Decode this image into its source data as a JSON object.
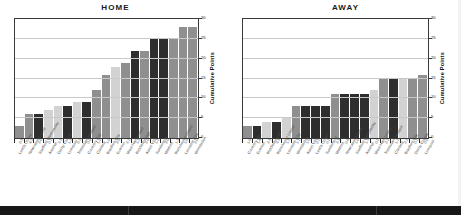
{
  "chart_data": [
    {
      "type": "bar",
      "title": "HOME",
      "xlabel": "",
      "ylabel": "Cumulative Points",
      "ylim": [
        0,
        30
      ],
      "yticks": [
        0,
        5,
        10,
        15,
        20,
        25,
        30
      ],
      "grid": true,
      "legend": "none",
      "categories": [
        "Leeds United",
        "Newcastle United",
        "Sheffield Wednesday",
        "Arsenal",
        "Derby County",
        "Liverpool",
        "Tottenham Hotspur",
        "Coventry City",
        "Chelsea",
        "Bradford City",
        "Everton",
        "West Ham United",
        "Middlesbrough",
        "Aston Villa",
        "Sunderland",
        "Watford",
        "Manchester United",
        "Leicester City",
        "Wimbledon"
      ],
      "scorelines": [
        "0-3",
        "4-2",
        "2-0",
        "0-1",
        "3-3",
        "1-1",
        "0-1",
        "0-0",
        "1-2",
        "1-0",
        "2-0",
        "2-1",
        "1-1",
        "2-0",
        "1-2",
        "2-0",
        "1-3",
        "1-0",
        "2-0"
      ],
      "values": [
        3,
        6,
        6,
        7,
        8,
        8,
        9,
        9,
        12,
        16,
        18,
        19,
        22,
        22,
        25,
        25,
        25,
        28,
        28
      ],
      "bar_shades": [
        "mid",
        "mid",
        "dark",
        "light",
        "light",
        "dark",
        "light",
        "dark",
        "mid",
        "mid",
        "light",
        "mid",
        "dark",
        "mid",
        "dark",
        "dark",
        "mid",
        "mid",
        "mid"
      ]
    },
    {
      "type": "bar",
      "title": "AWAY",
      "xlabel": "",
      "ylabel": "Cumulative Points",
      "ylim": [
        0,
        30
      ],
      "yticks": [
        0,
        5,
        10,
        15,
        20,
        25,
        30
      ],
      "grid": true,
      "legend": "none",
      "categories": [
        "Coventry City",
        "Everton",
        "Middlesbrough",
        "Manchester United",
        "Leicester City",
        "Wimbledon",
        "Aston Villa",
        "Leeds United",
        "Sunderland",
        "Watford",
        "Newcastle United",
        "Sheffield Wednesday",
        "Arsenal",
        "West Ham United",
        "Tottenham Hotspur",
        "Chelsea",
        "Bradford City",
        "Derby County",
        "Liverpool"
      ],
      "scorelines": [
        "1-0",
        "1-4",
        "2-3",
        "3-3",
        "1-3",
        "1-1",
        "1-0",
        "0-1",
        "0-2",
        "2-3",
        "0-6",
        "1-0",
        "1-3",
        "0-2",
        "2-1",
        "1-1",
        "2-1",
        "0-2",
        "0-0"
      ],
      "values": [
        3,
        3,
        4,
        4,
        5,
        8,
        8,
        8,
        8,
        11,
        11,
        11,
        11,
        12,
        15,
        15,
        15,
        15,
        16
      ],
      "bar_shades": [
        "mid",
        "dark",
        "light",
        "dark",
        "light",
        "mid",
        "dark",
        "dark",
        "dark",
        "mid",
        "dark",
        "dark",
        "dark",
        "light",
        "mid",
        "dark",
        "light",
        "mid",
        "mid"
      ]
    }
  ],
  "colors": {
    "bar_mid": "#8f8f8f",
    "bar_light": "#d2d2d2",
    "bar_dark": "#2e2e2e",
    "grid": "#c9c9c9",
    "axis": "#3a3a3a",
    "title": "#1a1a1a",
    "strip": "#171717"
  }
}
